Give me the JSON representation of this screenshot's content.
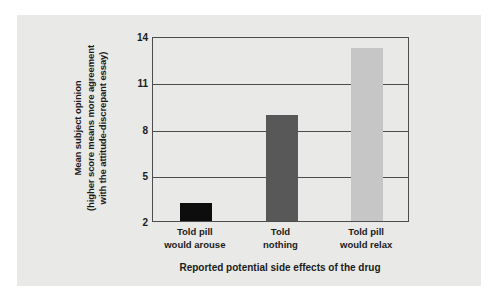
{
  "chart_data": {
    "type": "bar",
    "title": "",
    "xlabel": "Reported potential side effects of the drug",
    "ylabel_lines": [
      "Mean subject opinion",
      "(higher score means more agreement",
      "with the attitude-discrepant essay)"
    ],
    "categories": [
      "Told pill would arouse",
      "Told nothing",
      "Told pill would relax"
    ],
    "category_label_lines": [
      [
        "Told pill",
        "would arouse"
      ],
      [
        "Told",
        "nothing"
      ],
      [
        "Told pill",
        "would relax"
      ]
    ],
    "values": [
      3.2,
      8.9,
      13.2
    ],
    "ylim": [
      2,
      14
    ],
    "yticks": [
      "2",
      "5",
      "8",
      "11",
      "14"
    ],
    "ytick_values": [
      2,
      5,
      8,
      11,
      14
    ],
    "grid": "horizontal",
    "legend": "none",
    "bar_colors": [
      "#0d0d0d",
      "#585858",
      "#c6c6c6"
    ],
    "axis_color": "#4c4c4c",
    "panel_color": "#e9e9e7",
    "page_color": "#ffffff",
    "text_color": "#1b1b1b"
  }
}
